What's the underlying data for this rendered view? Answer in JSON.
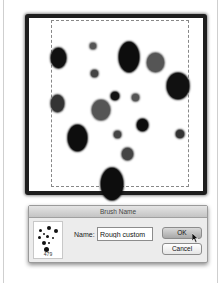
{
  "canvas": {
    "blobs": [
      {
        "x": 22,
        "y": 30,
        "w": 15,
        "h": 20,
        "color": "#111"
      },
      {
        "x": 61,
        "y": 25,
        "w": 6,
        "h": 6,
        "color": "#555"
      },
      {
        "x": 90,
        "y": 24,
        "w": 20,
        "h": 30,
        "color": "#0d0d0d"
      },
      {
        "x": 118,
        "y": 35,
        "w": 17,
        "h": 19,
        "color": "#555"
      },
      {
        "x": 62,
        "y": 52,
        "w": 7,
        "h": 7,
        "color": "#444"
      },
      {
        "x": 138,
        "y": 55,
        "w": 22,
        "h": 26,
        "color": "#111"
      },
      {
        "x": 22,
        "y": 77,
        "w": 13,
        "h": 17,
        "color": "#333"
      },
      {
        "x": 82,
        "y": 74,
        "w": 8,
        "h": 8,
        "color": "#111"
      },
      {
        "x": 103,
        "y": 76,
        "w": 7,
        "h": 7,
        "color": "#555"
      },
      {
        "x": 63,
        "y": 82,
        "w": 18,
        "h": 20,
        "color": "#555"
      },
      {
        "x": 108,
        "y": 101,
        "w": 11,
        "h": 12,
        "color": "#0d0d0d"
      },
      {
        "x": 147,
        "y": 112,
        "w": 8,
        "h": 8,
        "color": "#333"
      },
      {
        "x": 39,
        "y": 107,
        "w": 19,
        "h": 26,
        "color": "#0d0d0d"
      },
      {
        "x": 85,
        "y": 113,
        "w": 7,
        "h": 7,
        "color": "#444"
      },
      {
        "x": 93,
        "y": 130,
        "w": 11,
        "h": 12,
        "color": "#444"
      },
      {
        "x": 72,
        "y": 150,
        "w": 22,
        "h": 32,
        "color": "#0d0d0d"
      }
    ]
  },
  "dialog": {
    "title": "Brush Name",
    "thumbnail_size": "479",
    "name_label": "Name:",
    "name_value": "Rough custom",
    "ok_label": "OK",
    "cancel_label": "Cancel"
  }
}
